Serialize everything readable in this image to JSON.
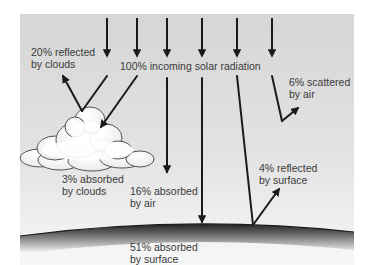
{
  "diagram": {
    "incoming": {
      "label": "100% incoming solar radiation",
      "value_pct": 100
    },
    "flows": [
      {
        "id": "reflected-clouds",
        "line1": "20% reflected",
        "line2": "by clouds",
        "value_pct": 20
      },
      {
        "id": "absorbed-clouds",
        "line1": "3% absorbed",
        "line2": "by clouds",
        "value_pct": 3
      },
      {
        "id": "absorbed-air",
        "line1": "16% absorbed",
        "line2": "by air",
        "value_pct": 16
      },
      {
        "id": "absorbed-surface",
        "line1": "51% absorbed",
        "line2": "by surface",
        "value_pct": 51
      },
      {
        "id": "reflected-surface",
        "line1": "4% reflected",
        "line2": "by surface",
        "value_pct": 4
      },
      {
        "id": "scattered-air",
        "line1": "6% scattered",
        "line2": "by air",
        "value_pct": 6
      }
    ],
    "colors": {
      "panel": "#d9d9d9",
      "arrow": "#1a1a1a",
      "text": "#3a3a3a",
      "cloud_fill": "#ffffff",
      "ground_dark": "#333333"
    }
  }
}
